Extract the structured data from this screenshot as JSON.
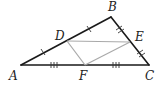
{
  "diagram": {
    "type": "triangle-midsegment",
    "points": {
      "A": {
        "label": "A",
        "x": 21,
        "y": 65,
        "lx": 9,
        "ly": 80
      },
      "B": {
        "label": "B",
        "x": 111,
        "y": 17,
        "lx": 108,
        "ly": 11
      },
      "C": {
        "label": "C",
        "x": 149,
        "y": 65,
        "lx": 145,
        "ly": 80
      },
      "D": {
        "label": "D",
        "x": 67,
        "y": 41,
        "lx": 55,
        "ly": 40
      },
      "E": {
        "label": "E",
        "x": 130,
        "y": 42,
        "lx": 135,
        "ly": 41
      },
      "F": {
        "label": "F",
        "x": 85,
        "y": 65,
        "lx": 79,
        "ly": 80
      }
    },
    "sides": [
      "AB",
      "BC",
      "CA"
    ],
    "midsegments": [
      "DE",
      "EF",
      "FD"
    ],
    "tick_marks": {
      "AD_DB": 1,
      "BE_EC": 2,
      "AF_FC": 3
    },
    "colors": {
      "side": "#1a1a1a",
      "midsegment": "#a9a9a9",
      "background": "#ffffff"
    }
  }
}
